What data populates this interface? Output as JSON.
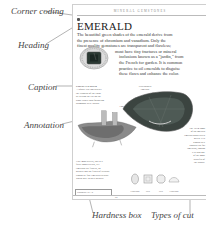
{
  "callouts": {
    "corner_coding": "Corner coding",
    "heading": "Heading",
    "caption": "Caption",
    "annotation": "Annotation",
    "hardness_box": "Hardness box",
    "types_of_cut": "Types of cut"
  },
  "page": {
    "running_head": "MINERAL GEMSTONES",
    "heading": "EMERALD",
    "intro_lines": [
      "The beautiful green shades of the emerald derive from",
      "the presence of chromium and vanadium. Only the",
      "finest quality gemstones are transparent and flawless;",
      "most have tiny fractures or mineral",
      "inclusions known as a \"jardin,\" from",
      "the French for garden. It is common",
      "practice to oil emeralds to disguise",
      "these flaws and enhance the color."
    ],
    "caption_title": "EMERALD RING",
    "caption_lines": [
      "A square-cut emerald set",
      "the richness of the color",
      "by setting the cut on the",
      "stone rather than following",
      "diamonds were drawn."
    ],
    "pear_label": "Pear-shaped emerald",
    "crystal_label": "Emerald crystal in matrix",
    "bottom_lines": [
      "Like most beryls, this is a",
      "fairly good crystal, yet",
      "emeralds are flawed, so",
      "owners and the flaws of crystals",
      "cannot be fine emerald crystals",
      "worth able to their owners."
    ],
    "hardness_text": "Hardness 7.5 – 8",
    "right_lines": [
      "Pear-shaped emerald",
      "The 1874 tomb",
      "of an emerald",
      "emerald glows deep",
      "green. It is",
      "known as a",
      "popular cut for",
      "emeralds, though",
      "it is also one",
      "of the most",
      "wasteful of",
      "the stones."
    ],
    "cut_types": [
      "Cabochon",
      "Step",
      "Step",
      "Cabochon"
    ],
    "page_number": "82"
  }
}
